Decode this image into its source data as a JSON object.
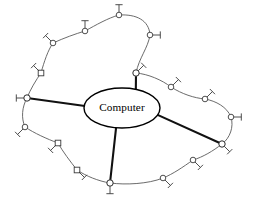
{
  "diagram": {
    "type": "wireless-network-topology",
    "canvas": {
      "width": 254,
      "height": 202,
      "background": "#ffffff"
    },
    "center": {
      "label": "Computer",
      "shape": "ellipse",
      "cx": 122,
      "cy": 108,
      "rx": 38,
      "ry": 20,
      "stroke": "#000000",
      "fill": "#ffffff"
    },
    "styles": {
      "ring_link_color": "#5a5a5a",
      "spoke_link_color": "#111111",
      "node_stroke": "#3a3a3a",
      "node_fill": "#ffffff"
    },
    "hubs": [
      {
        "id": "hub-top",
        "name": "access-point-top",
        "x": 136,
        "y": 73,
        "antenna": "up-right",
        "shape": "circle"
      },
      {
        "id": "hub-left",
        "name": "access-point-left",
        "x": 27,
        "y": 98,
        "antenna": "left",
        "shape": "circle"
      },
      {
        "id": "hub-right",
        "name": "access-point-right",
        "x": 222,
        "y": 144,
        "antenna": "down-right",
        "shape": "circle"
      },
      {
        "id": "hub-bottom",
        "name": "access-point-bottom",
        "x": 110,
        "y": 183,
        "antenna": "down",
        "shape": "circle"
      }
    ],
    "nodes": [
      {
        "id": "n01",
        "name": "wireless-node-01",
        "x": 53,
        "y": 43,
        "antenna": "up-left",
        "shape": "circle"
      },
      {
        "id": "n02",
        "name": "wireless-node-02",
        "x": 85,
        "y": 31,
        "antenna": "up",
        "shape": "circle"
      },
      {
        "id": "n03",
        "name": "wireless-node-03",
        "x": 119,
        "y": 15,
        "antenna": "up",
        "shape": "circle"
      },
      {
        "id": "n04",
        "name": "wireless-node-04",
        "x": 150,
        "y": 35,
        "antenna": "right",
        "shape": "circle"
      },
      {
        "id": "n05",
        "name": "wireless-node-05",
        "x": 171,
        "y": 87,
        "antenna": "up-right",
        "shape": "circle"
      },
      {
        "id": "n06",
        "name": "wireless-node-06",
        "x": 205,
        "y": 99,
        "antenna": "up-right",
        "shape": "circle"
      },
      {
        "id": "n07",
        "name": "wireless-node-07",
        "x": 231,
        "y": 117,
        "antenna": "right",
        "shape": "circle"
      },
      {
        "id": "n08",
        "name": "wireless-node-08",
        "x": 193,
        "y": 160,
        "antenna": "down-right",
        "shape": "circle"
      },
      {
        "id": "n09",
        "name": "wireless-node-09",
        "x": 163,
        "y": 178,
        "antenna": "down-right",
        "shape": "circle"
      },
      {
        "id": "n10",
        "name": "wireless-node-10",
        "x": 77,
        "y": 170,
        "antenna": "down-right",
        "shape": "square"
      },
      {
        "id": "n11",
        "name": "wireless-node-11",
        "x": 58,
        "y": 143,
        "antenna": "down-left",
        "shape": "square"
      },
      {
        "id": "n12",
        "name": "wireless-node-12",
        "x": 25,
        "y": 127,
        "antenna": "down-left",
        "shape": "circle"
      },
      {
        "id": "n13",
        "name": "wireless-node-13",
        "x": 41,
        "y": 73,
        "antenna": "up-left",
        "shape": "square"
      }
    ],
    "spokes": [
      {
        "from": "center",
        "to": "hub-top",
        "name": "spoke-center-to-top"
      },
      {
        "from": "center",
        "to": "hub-left",
        "name": "spoke-center-to-left"
      },
      {
        "from": "center",
        "to": "hub-right",
        "name": "spoke-center-to-right"
      },
      {
        "from": "center",
        "to": "hub-bottom",
        "name": "spoke-center-to-bottom"
      }
    ],
    "ring_segments": [
      {
        "name": "ring-segment-left-to-n13",
        "d": "M 27,98 C 30,90 36,80 41,73"
      },
      {
        "name": "ring-segment-n13-to-n01",
        "d": "M 41,73 C 44,62 48,50 53,43"
      },
      {
        "name": "ring-segment-n01-to-n02",
        "d": "M 53,43 C 64,38 75,34 85,31"
      },
      {
        "name": "ring-segment-n02-to-n03",
        "d": "M 85,31 C 96,25 108,18 119,15"
      },
      {
        "name": "ring-segment-n03-to-n04",
        "d": "M 119,15 C 136,14 149,20 150,35"
      },
      {
        "name": "ring-segment-n04-to-hubtop",
        "d": "M 150,35 C 148,48 139,58 136,73"
      },
      {
        "name": "ring-segment-hubtop-to-n05",
        "d": "M 136,73 C 148,74 162,80 171,87"
      },
      {
        "name": "ring-segment-n05-to-n06",
        "d": "M 171,87 C 182,94 194,98 205,99"
      },
      {
        "name": "ring-segment-n06-to-n07",
        "d": "M 205,99 C 216,101 227,107 231,117"
      },
      {
        "name": "ring-segment-n07-to-hubr",
        "d": "M 231,117 C 234,127 230,138 222,144"
      },
      {
        "name": "ring-segment-hubr-to-n08",
        "d": "M 222,144 C 213,151 203,157 193,160"
      },
      {
        "name": "ring-segment-n08-to-n09",
        "d": "M 193,160 C 183,167 173,174 163,178"
      },
      {
        "name": "ring-segment-n09-to-hubb",
        "d": "M 163,178 C 148,184 126,185 110,183"
      },
      {
        "name": "ring-segment-hubb-to-n10",
        "d": "M 110,183 C 98,181 86,176 77,170"
      },
      {
        "name": "ring-segment-n10-to-n11",
        "d": "M 77,170 C 70,161 63,152 58,143"
      },
      {
        "name": "ring-segment-n11-to-n12",
        "d": "M 58,143 C 47,139 34,133 25,127"
      },
      {
        "name": "ring-segment-n12-to-hubl",
        "d": "M 25,127 C 21,118 22,107 27,98"
      }
    ]
  }
}
